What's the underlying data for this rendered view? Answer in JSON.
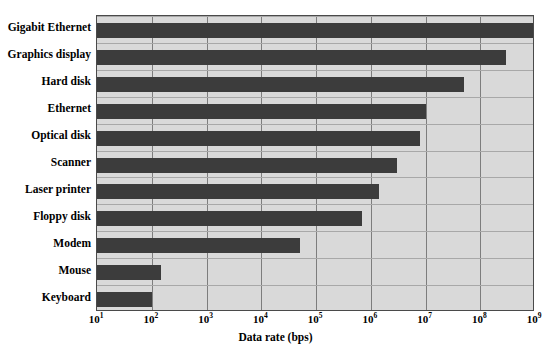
{
  "chart_data": {
    "type": "bar",
    "orientation": "horizontal",
    "title": "",
    "xlabel": "Data rate (bps)",
    "ylabel": "",
    "xscale": "log",
    "xlim": [
      10,
      1000000000
    ],
    "grid": true,
    "legend": null,
    "bar_color": "#3c3c3c",
    "plot_background": "#d9d9d9",
    "xticks": [
      {
        "label": "10",
        "exp": "1",
        "value": 10
      },
      {
        "label": "10",
        "exp": "2",
        "value": 100
      },
      {
        "label": "10",
        "exp": "3",
        "value": 1000
      },
      {
        "label": "10",
        "exp": "4",
        "value": 10000
      },
      {
        "label": "10",
        "exp": "5",
        "value": 100000
      },
      {
        "label": "10",
        "exp": "6",
        "value": 1000000
      },
      {
        "label": "10",
        "exp": "7",
        "value": 10000000
      },
      {
        "label": "10",
        "exp": "8",
        "value": 100000000
      },
      {
        "label": "10",
        "exp": "9",
        "value": 1000000000
      }
    ],
    "categories": [
      "Gigabit Ethernet",
      "Graphics display",
      "Hard disk",
      "Ethernet",
      "Optical disk",
      "Scanner",
      "Laser printer",
      "Floppy disk",
      "Modem",
      "Mouse",
      "Keyboard"
    ],
    "values": [
      1000000000,
      300000000,
      50000000,
      10000000,
      8000000,
      3000000,
      1400000,
      700000,
      50000,
      150,
      100
    ]
  }
}
